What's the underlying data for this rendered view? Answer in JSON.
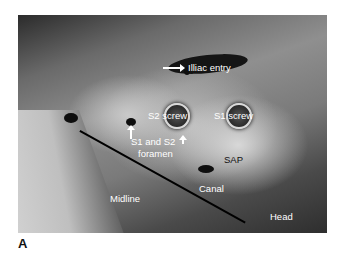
{
  "figure": {
    "panel_label": "A"
  },
  "labels": {
    "iliac_entry": "Illiac entry",
    "s2_screw": "S2 screw",
    "s1_screw": "S1 screw",
    "foramen_line1": "S1 and S2",
    "foramen_line2": "foramen",
    "sap": "SAP",
    "canal": "Canal",
    "midline": "Midline",
    "head": "Head"
  },
  "annotations": {
    "arrows": [
      {
        "target": "iliac entry point",
        "direction": "right",
        "color": "#ffffff"
      },
      {
        "target": "S1 foramen",
        "direction": "up",
        "color": "#ffffff"
      },
      {
        "target": "S2 foramen",
        "direction": "up",
        "color": "#ffffff"
      }
    ],
    "midline_line": {
      "color": "#000000",
      "from": [
        80,
        130
      ],
      "to": [
        246,
        222
      ]
    }
  },
  "colors": {
    "label_light": "#ffffff",
    "label_dark": "#111111",
    "background": "#ffffff"
  }
}
